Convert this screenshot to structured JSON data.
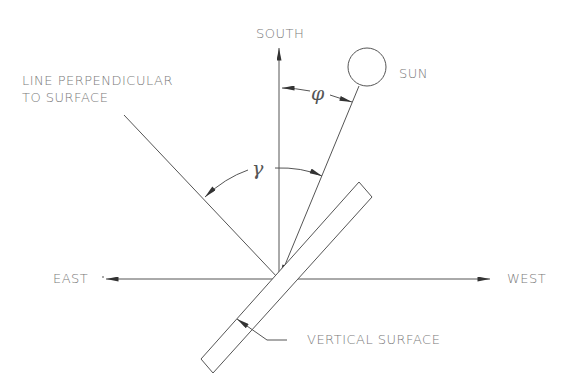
{
  "labels": {
    "south": "SOUTH",
    "sun": "SUN",
    "east": "EAST",
    "west": "WEST",
    "perpendicular_line1": "LINE PERPENDICULAR",
    "perpendicular_line2": "TO SURFACE",
    "vertical_surface": "VERTICAL SURFACE"
  },
  "angles": {
    "phi": "φ",
    "gamma": "γ"
  },
  "colors": {
    "line": "#555555",
    "text": "#7a7a7a",
    "background": "#ffffff"
  }
}
